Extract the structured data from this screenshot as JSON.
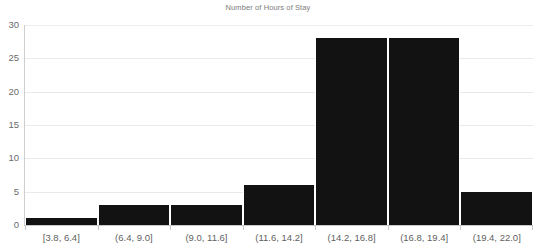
{
  "chart_data": {
    "type": "bar",
    "title": "Number of Hours of Stay",
    "xlabel": "",
    "ylabel": "",
    "categories": [
      "[3.8, 6.4]",
      "(6.4, 9.0]",
      "(9.0, 11.6]",
      "(11.6, 14.2]",
      "(14.2, 16.8]",
      "(16.8, 19.4]",
      "(19.4, 22.0]"
    ],
    "values": [
      1,
      3,
      3,
      6,
      28,
      28,
      5
    ],
    "ylim": [
      0,
      30
    ],
    "yticks": [
      0,
      5,
      10,
      15,
      20,
      25,
      30
    ],
    "ytick_labels": [
      "0",
      "5",
      "10",
      "15",
      "20",
      "25",
      "30"
    ],
    "grid": true,
    "legend": null,
    "bar_color": "#121212",
    "gridline_color": "#e9e9e9",
    "axis_color": "#c9c9c9",
    "title_color": "#7c7c7c",
    "tick_label_color": "#636363"
  }
}
